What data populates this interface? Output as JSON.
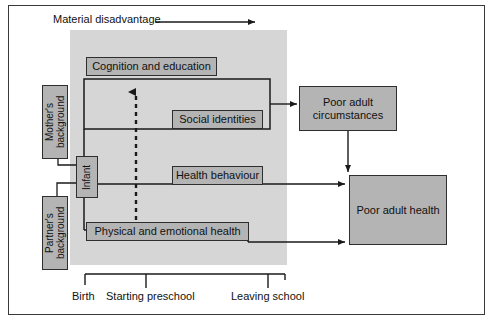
{
  "diagram": {
    "header_label": "Material disadvantage",
    "colors": {
      "panel_fill": "#d6d6d6",
      "box_fill": "#b4b4b4",
      "box_stroke": "#2e2e2e",
      "line": "#1a1a1a",
      "frame": "#3a3a3a",
      "text": "#111111"
    },
    "nodes": {
      "mothers_background": "Mother's\nbackground",
      "mothers_background_line1": "Mother's",
      "mothers_background_line2": "background",
      "partners_background_line1": "Partner's",
      "partners_background_line2": "background",
      "infant": "Infant",
      "cognition_and_education": "Cognition and education",
      "social_identities": "Social identities",
      "health_behaviour": "Health behaviour",
      "physical_and_emotional_health": "Physical and emotional health",
      "poor_adult_circumstances_line1": "Poor adult",
      "poor_adult_circumstances_line2": "circumstances",
      "poor_adult_health": "Poor adult health"
    },
    "timeline": {
      "ticks": [
        {
          "label": "Birth"
        },
        {
          "label": "Starting preschool"
        },
        {
          "label": "Leaving school"
        }
      ]
    },
    "arrows": {
      "material_disadvantage_direction": "right",
      "upward_dashed": "developmental influence",
      "to_poor_adult_circumstances": "social identities to poor adult circumstances",
      "circumstances_to_health": "poor adult circumstances to poor adult health",
      "health_behaviour_to_health": "health behaviour to poor adult health",
      "physical_health_to_health": "physical and emotional health to poor adult health"
    }
  }
}
